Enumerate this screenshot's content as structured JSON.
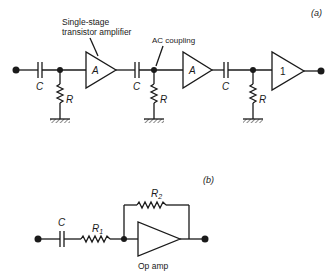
{
  "circuit_a": {
    "panel_label": "(a)",
    "annotation_amp": [
      "Single-stage",
      "transistor amplifier"
    ],
    "annotation_coupling": "AC coupling",
    "stages": [
      {
        "capacitor": "C",
        "resistor": "R",
        "amplifier": "A"
      },
      {
        "capacitor": "C",
        "resistor": "R",
        "amplifier": "A"
      },
      {
        "capacitor": "C",
        "resistor": "R",
        "amplifier": "1"
      }
    ]
  },
  "circuit_b": {
    "panel_label": "(b)",
    "capacitor": "C",
    "input_resistor": "R",
    "input_resistor_sub": "1",
    "feedback_resistor": "R",
    "feedback_resistor_sub": "2",
    "amp_label": "Op amp"
  }
}
